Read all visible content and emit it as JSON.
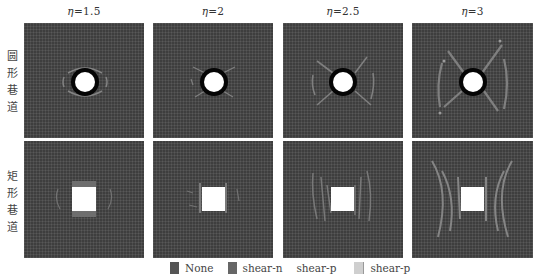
{
  "figure": {
    "columns": [
      {
        "label": "η=1.5",
        "eta_symbol": "η",
        "value": "=1.5"
      },
      {
        "label": "η=2",
        "eta_symbol": "η",
        "value": "=2"
      },
      {
        "label": "η=2.5",
        "eta_symbol": "η",
        "value": "=2.5"
      },
      {
        "label": "η=3",
        "eta_symbol": "η",
        "value": "=3"
      }
    ],
    "rows": [
      {
        "label": "圆形巷道",
        "chars": [
          "圆",
          "形",
          "巷",
          "道"
        ],
        "shape": "circle"
      },
      {
        "label": "矩形巷道",
        "chars": [
          "矩",
          "形",
          "巷",
          "道"
        ],
        "shape": "square"
      }
    ],
    "legend": [
      {
        "label": "None",
        "color": "#555555"
      },
      {
        "label": "shear-n",
        "color": "#666666"
      },
      {
        "label": "shear-p",
        "color": null
      },
      {
        "label": "shear-p",
        "color": "#cfcfcf"
      }
    ],
    "colors": {
      "background": "#3e3e3e",
      "plastic_zone": "#8a8a8a",
      "opening": "#ffffff",
      "circle_ring": "#050505"
    }
  }
}
